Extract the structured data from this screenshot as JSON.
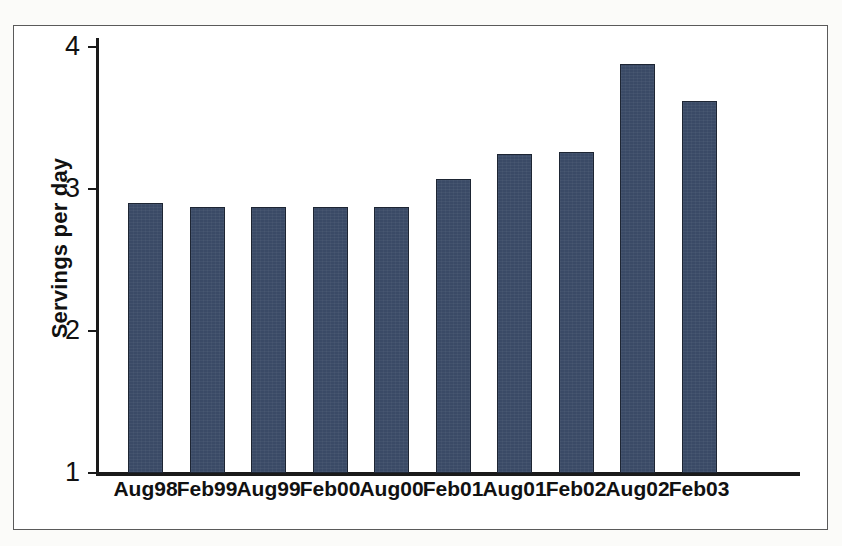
{
  "figure": {
    "background_color": "#ffffff",
    "frame_color": "#5a5a5a",
    "axis_color": "#1a1a1a"
  },
  "chart_data": {
    "type": "bar",
    "title": "",
    "subtitle": "",
    "xlabel": "",
    "ylabel": "Servings per day",
    "categories": [
      "Aug98",
      "Feb99",
      "Aug99",
      "Feb00",
      "Aug00",
      "Feb01",
      "Aug01",
      "Feb02",
      "Aug02",
      "Feb03"
    ],
    "values": [
      2.9,
      2.87,
      2.87,
      2.87,
      2.87,
      3.07,
      3.25,
      3.26,
      3.88,
      3.62
    ],
    "series": [
      {
        "name": "Servings per day",
        "values": [
          2.9,
          2.87,
          2.87,
          2.87,
          2.87,
          3.07,
          3.25,
          3.26,
          3.88,
          3.62
        ],
        "color": "#3a4a66"
      }
    ],
    "ylim": [
      1,
      4
    ],
    "yticks": [
      1,
      2,
      3,
      4
    ],
    "ytick_labels": [
      "1",
      "2",
      "3",
      "4"
    ],
    "grid": false,
    "legend": false,
    "legend_position": "none",
    "bar_color": "#3a4a66",
    "bar_edge_color": "#1d2533",
    "annotations": []
  }
}
